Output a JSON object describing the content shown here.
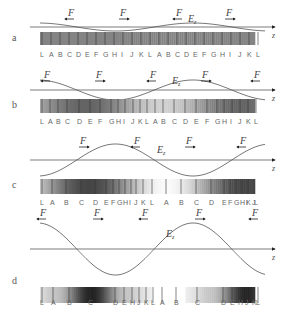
{
  "figure": {
    "force_label": "F",
    "field_label": "E",
    "field_subscript": "z",
    "axis_label": "z",
    "panels": [
      {
        "id": "a",
        "axis_y": 27,
        "amplitude": 4,
        "wavelength": 155,
        "bar_y": 32,
        "bar_h": 13,
        "label_y": 57,
        "letters": [
          "L",
          "A",
          "B",
          "C",
          "D",
          "E",
          "F",
          "G",
          "H",
          "I",
          "J",
          "K",
          "L",
          "A",
          "B",
          "C",
          "D",
          "E",
          "F",
          "G",
          "H",
          "I",
          "J",
          "K",
          "L"
        ],
        "letter_x": [
          40,
          49,
          58,
          67,
          76,
          85,
          94,
          103,
          112,
          121,
          130,
          139,
          148,
          157,
          166,
          175,
          184,
          193,
          202,
          211,
          220,
          229,
          238,
          247,
          256
        ],
        "forces": [
          {
            "x": 68,
            "y": 16,
            "dir": "left"
          },
          {
            "x": 120,
            "y": 16,
            "dir": "right"
          },
          {
            "x": 176,
            "y": 16,
            "dir": "left"
          },
          {
            "x": 226,
            "y": 16,
            "dir": "right"
          }
        ],
        "ez_x": 188,
        "ez_y": 22,
        "darkness": "uniform"
      },
      {
        "id": "b",
        "axis_y": 90,
        "amplitude": 10,
        "wavelength": 155,
        "bar_y": 99,
        "bar_h": 14,
        "label_y": 124,
        "letters": [
          "L",
          "A",
          "B",
          "C",
          "D",
          "E",
          "F",
          "G",
          "H",
          "I",
          "J",
          "K",
          "L",
          "A",
          "B",
          "C",
          "D",
          "E",
          "F",
          "G",
          "H",
          "I",
          "J",
          "K",
          "L"
        ],
        "letter_x": [
          40,
          48,
          56,
          65,
          77,
          88,
          98,
          109,
          116,
          123,
          131,
          138,
          145,
          153,
          161,
          172,
          183,
          194,
          205,
          215,
          222,
          230,
          238,
          246,
          254
        ],
        "forces": [
          {
            "x": 44,
            "y": 78,
            "dir": "left"
          },
          {
            "x": 96,
            "y": 78,
            "dir": "right"
          },
          {
            "x": 150,
            "y": 78,
            "dir": "left"
          },
          {
            "x": 202,
            "y": 78,
            "dir": "right"
          },
          {
            "x": 254,
            "y": 78,
            "dir": "left"
          }
        ],
        "ez_x": 172,
        "ez_y": 84,
        "darkness": "mild"
      },
      {
        "id": "c",
        "axis_y": 160,
        "amplitude": 16,
        "wavelength": 155,
        "bar_y": 179,
        "bar_h": 15,
        "label_y": 205,
        "letters": [
          "L",
          "A",
          "B",
          "C",
          "D",
          "E",
          "F",
          "G",
          "H",
          "I",
          "J",
          "K",
          "L",
          "A",
          "B",
          "C",
          "D",
          "E",
          "F",
          "G",
          "H",
          "I",
          "J",
          "K",
          "L"
        ],
        "letter_x": [
          40,
          50,
          64,
          79,
          93,
          104,
          111,
          117,
          123,
          129,
          134,
          141,
          150,
          164,
          179,
          194,
          209,
          222,
          228,
          234,
          240,
          246,
          252,
          246,
          254
        ],
        "forces": [
          {
            "x": 80,
            "y": 144,
            "dir": "right"
          },
          {
            "x": 134,
            "y": 144,
            "dir": "left"
          },
          {
            "x": 186,
            "y": 144,
            "dir": "right"
          },
          {
            "x": 240,
            "y": 144,
            "dir": "left"
          }
        ],
        "ez_x": 157,
        "ez_y": 153,
        "darkness": "strong"
      },
      {
        "id": "d",
        "axis_y": 249,
        "amplitude": 26,
        "wavelength": 155,
        "bar_y": 287,
        "bar_h": 16,
        "label_y": 305,
        "letters": [
          "L",
          "A",
          "B",
          "C",
          "D",
          "E",
          "H",
          "J",
          "K",
          "L",
          "A",
          "B",
          "C",
          "D",
          "E",
          "H",
          "J",
          "K",
          "L"
        ],
        "letter_x": [
          40,
          51,
          67,
          88,
          113,
          122,
          130,
          137,
          144,
          151,
          160,
          174,
          195,
          221,
          230,
          238,
          245,
          252,
          256
        ],
        "forces": [
          {
            "x": 40,
            "y": 216,
            "dir": "left"
          },
          {
            "x": 94,
            "y": 216,
            "dir": "right"
          },
          {
            "x": 142,
            "y": 216,
            "dir": "left"
          },
          {
            "x": 196,
            "y": 216,
            "dir": "right"
          },
          {
            "x": 252,
            "y": 216,
            "dir": "left"
          }
        ],
        "ez_x": 166,
        "ez_y": 237,
        "darkness": "clustered"
      }
    ]
  }
}
